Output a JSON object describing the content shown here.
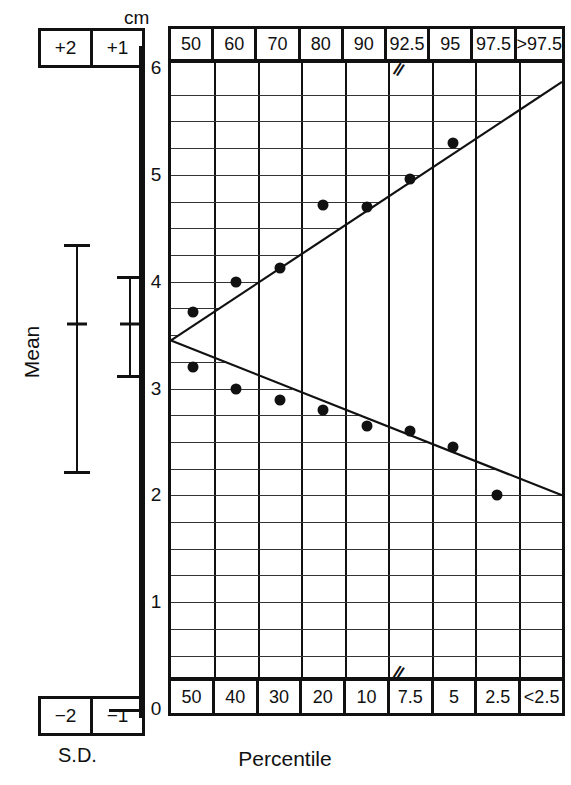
{
  "axis": {
    "unit_label": "cm",
    "ticks": [
      0,
      1,
      2,
      3,
      4,
      5,
      6
    ],
    "tick_labels": [
      "0",
      "1",
      "2",
      "3",
      "4",
      "5",
      "6"
    ]
  },
  "sd_panel": {
    "caption": "S.D.",
    "mean_label": "Mean",
    "top_boxes": [
      "+2",
      "+1"
    ],
    "bottom_boxes": [
      "−2",
      "−1"
    ],
    "bars": [
      {
        "name": "two-sd-bar",
        "center_cm": 3.6,
        "upper_cm": 4.35,
        "lower_cm": 2.2
      },
      {
        "name": "one-sd-bar",
        "center_cm": 3.6,
        "upper_cm": 4.05,
        "lower_cm": 3.1
      }
    ]
  },
  "chart_data": {
    "type": "line",
    "title": "",
    "xlabel": "Percentile",
    "ylabel": "cm",
    "ylim": [
      0,
      6
    ],
    "grid": true,
    "legend": "none",
    "top_axis_labels": [
      "50",
      "60",
      "70",
      "80",
      "90",
      "92.5",
      "95",
      "97.5",
      ">97.5"
    ],
    "bottom_axis_labels": [
      "50",
      "40",
      "30",
      "20",
      "10",
      "7.5",
      "5",
      "2.5",
      "<2.5"
    ],
    "break_marker": "//",
    "break_after_column_index": 4,
    "series": [
      {
        "name": "upper-percentile-curve",
        "x": [
          "50",
          "60",
          "70",
          "80",
          "90",
          "92.5",
          "95",
          "97.5",
          ">97.5"
        ],
        "values": [
          3.72,
          4.0,
          4.13,
          4.72,
          4.7,
          4.96,
          5.3,
          5.62,
          5.85
        ],
        "points": [
          {
            "label": "50",
            "cm": 3.72
          },
          {
            "label": "60",
            "cm": 4.0
          },
          {
            "label": "70",
            "cm": 4.13
          },
          {
            "label": "80",
            "cm": 4.72
          },
          {
            "label": "90",
            "cm": 4.7
          },
          {
            "label": "92.5",
            "cm": 4.96
          },
          {
            "label": "95",
            "cm": 5.3
          }
        ],
        "line_from_cm": 3.45,
        "line_to_cm": 5.87
      },
      {
        "name": "lower-percentile-curve",
        "x": [
          "50",
          "40",
          "30",
          "20",
          "10",
          "7.5",
          "5",
          "2.5",
          "<2.5"
        ],
        "values": [
          3.2,
          3.0,
          2.89,
          2.8,
          2.65,
          2.6,
          2.45,
          2.2,
          2.0
        ],
        "points": [
          {
            "label": "50",
            "cm": 3.2
          },
          {
            "label": "40",
            "cm": 3.0
          },
          {
            "label": "30",
            "cm": 2.89
          },
          {
            "label": "20",
            "cm": 2.8
          },
          {
            "label": "10",
            "cm": 2.65
          },
          {
            "label": "7.5",
            "cm": 2.6
          },
          {
            "label": "5",
            "cm": 2.45
          },
          {
            "label": "2.5",
            "cm": 2.0
          }
        ],
        "line_from_cm": 3.45,
        "line_to_cm": 2.0
      }
    ]
  }
}
